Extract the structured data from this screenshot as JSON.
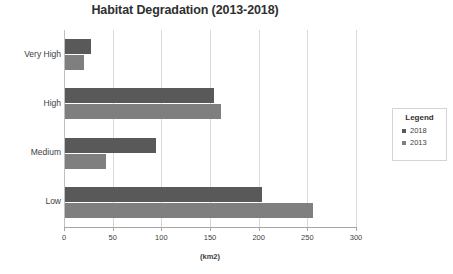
{
  "chart_data": {
    "type": "bar",
    "orientation": "horizontal",
    "title": "Habitat Degradation (2013-2018)",
    "xlabel": "(km2)",
    "ylabel": "",
    "categories": [
      "Very High",
      "High",
      "Medium",
      "Low"
    ],
    "series": [
      {
        "name": "2018",
        "values": [
          27,
          153,
          93,
          202
        ],
        "color": "#595959"
      },
      {
        "name": "2013",
        "values": [
          20,
          160,
          42,
          255
        ],
        "color": "#7f7f7f"
      }
    ],
    "xlim": [
      0,
      300
    ],
    "xticks": [
      0,
      50,
      100,
      150,
      200,
      250,
      300
    ],
    "xtick_labels": [
      "0",
      "50",
      "100",
      "150",
      "200",
      "250",
      "300"
    ],
    "grid": "vertical",
    "legend": {
      "title": "Legend",
      "position": "right",
      "entries": [
        {
          "label": "2018",
          "color": "#595959"
        },
        {
          "label": "2013",
          "color": "#7f7f7f"
        }
      ]
    }
  }
}
